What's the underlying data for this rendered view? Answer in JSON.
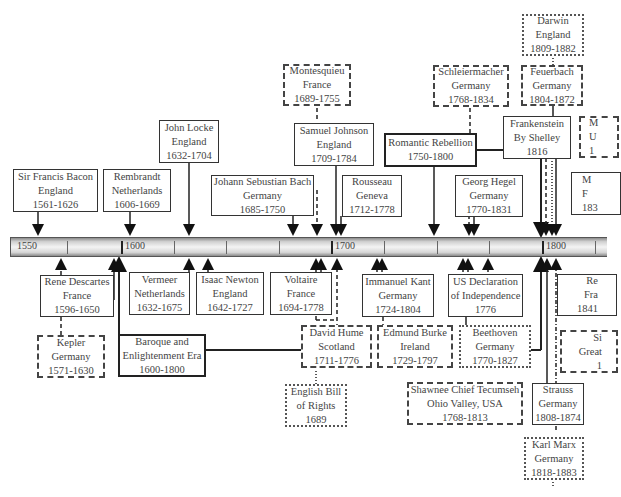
{
  "timeline": {
    "ticks": [
      {
        "label": "1550",
        "x": 14
      },
      {
        "label": "1600",
        "x": 122
      },
      {
        "label": "1700",
        "x": 331
      },
      {
        "label": "1800",
        "x": 542
      }
    ],
    "minor_ticks_x": [
      66,
      173,
      226,
      279,
      385,
      436,
      488,
      595
    ]
  },
  "boxes_above": [
    {
      "id": "bacon",
      "lines": [
        "Sir Francis Bacon",
        "England",
        "1561-1626"
      ],
      "style": "solid"
    },
    {
      "id": "rembrandt",
      "lines": [
        "Rembrandt",
        "Netherlands",
        "1606-1669"
      ],
      "style": "solid"
    },
    {
      "id": "locke",
      "lines": [
        "John Locke",
        "England",
        "1632-1704"
      ],
      "style": "solid"
    },
    {
      "id": "bach",
      "lines": [
        "Johann Sebustian Bach",
        "Germany",
        "1685-1750"
      ],
      "style": "solid"
    },
    {
      "id": "montesquieu",
      "lines": [
        "Montesquieu",
        "France",
        "1689-1755"
      ],
      "style": "dashed"
    },
    {
      "id": "johnson",
      "lines": [
        "Samuel Johnson",
        "England",
        "1709-1784"
      ],
      "style": "solid"
    },
    {
      "id": "rousseau",
      "lines": [
        "Rousseau",
        "Geneva",
        "1712-1778"
      ],
      "style": "solid"
    },
    {
      "id": "romantic",
      "lines": [
        "Romantic Rebellion",
        "1750-1800"
      ],
      "style": "thick"
    },
    {
      "id": "schleiermacher",
      "lines": [
        "Schleiermacher",
        "Germany",
        "1768-1834"
      ],
      "style": "dashed"
    },
    {
      "id": "hegel",
      "lines": [
        "Georg Hegel",
        "Germany",
        "1770-1831"
      ],
      "style": "solid"
    },
    {
      "id": "darwin",
      "lines": [
        "Darwin",
        "England",
        "1809-1882"
      ],
      "style": "dotted"
    },
    {
      "id": "feuerbach",
      "lines": [
        "Feuerbach",
        "Germany",
        "1804-1872"
      ],
      "style": "dashed"
    },
    {
      "id": "frankenstein",
      "lines": [
        "Frankenstein",
        "By Shelley",
        "1816"
      ],
      "style": "solid"
    },
    {
      "id": "partial-mu",
      "lines": [
        "M",
        "U",
        "1"
      ],
      "style": "dashed"
    },
    {
      "id": "partial-mf",
      "lines": [
        "M",
        "F",
        "183"
      ],
      "style": "solid"
    }
  ],
  "boxes_below": [
    {
      "id": "descartes",
      "lines": [
        "Rene Descartes",
        "France",
        "1596-1650"
      ],
      "style": "solid"
    },
    {
      "id": "kepler",
      "lines": [
        "Kepler",
        "Germany",
        "1571-1630"
      ],
      "style": "dashed"
    },
    {
      "id": "vermeer",
      "lines": [
        "Vermeer",
        "Netherlands",
        "1632-1675"
      ],
      "style": "solid"
    },
    {
      "id": "baroque",
      "lines": [
        "Baroque and",
        "Enlightenment Era",
        "1600-1800"
      ],
      "style": "thick"
    },
    {
      "id": "newton",
      "lines": [
        "Isaac Newton",
        "England",
        "1642-1727"
      ],
      "style": "solid"
    },
    {
      "id": "voltaire",
      "lines": [
        "Voltaire",
        "France",
        "1694-1778"
      ],
      "style": "solid"
    },
    {
      "id": "hume",
      "lines": [
        "David Hume",
        "Scotland",
        "1711-1776"
      ],
      "style": "dashed"
    },
    {
      "id": "billofrights",
      "lines": [
        "English Bill",
        "of Rights",
        "1689"
      ],
      "style": "dotted"
    },
    {
      "id": "kant",
      "lines": [
        "Immanuel Kant",
        "Germany",
        "1724-1804"
      ],
      "style": "solid"
    },
    {
      "id": "burke",
      "lines": [
        "Edmund Burke",
        "Ireland",
        "1729-1797"
      ],
      "style": "dashed"
    },
    {
      "id": "usdeclaration",
      "lines": [
        "US Declaration",
        "of Independence",
        "1776"
      ],
      "style": "solid"
    },
    {
      "id": "beethoven",
      "lines": [
        "Beethoven",
        "Germany",
        "1770-1827"
      ],
      "style": "dotted"
    },
    {
      "id": "tecumseh",
      "lines": [
        "Shawnee Chief Tecumseh",
        "Ohio Valley, USA",
        "1768-1813"
      ],
      "style": "dashed"
    },
    {
      "id": "strauss",
      "lines": [
        "Strauss",
        "Germany",
        "1808-1874"
      ],
      "style": "solid"
    },
    {
      "id": "marx",
      "lines": [
        "Karl Marx",
        "Germany",
        "1818-1883"
      ],
      "style": "dotted"
    },
    {
      "id": "partial-re",
      "lines": [
        "Re",
        "Fra",
        "1841"
      ],
      "style": "solid"
    },
    {
      "id": "partial-si",
      "lines": [
        "Si",
        "Great",
        "1"
      ],
      "style": "dashed"
    }
  ]
}
